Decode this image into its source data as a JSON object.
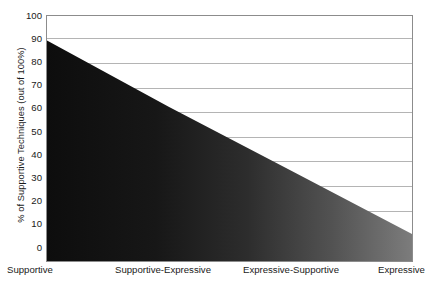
{
  "chart_data": {
    "type": "area",
    "title": "",
    "subtitle": "",
    "xlabel": "",
    "ylabel": "% of Supportive Techniques (out of 100%)",
    "categories": [
      "Supportive",
      "Supportive-Expressive",
      "Expressive-Supportive",
      "Expressive"
    ],
    "x": [
      0,
      1,
      2,
      3
    ],
    "values": [
      90,
      63,
      37,
      11
    ],
    "series": [
      {
        "name": "% of Supportive Techniques",
        "values": [
          90,
          63,
          37,
          11
        ]
      }
    ],
    "ylim": [
      0,
      100
    ],
    "yticks": [
      0,
      10,
      20,
      30,
      40,
      50,
      60,
      70,
      80,
      90,
      100
    ],
    "ytick_labels": [
      "0",
      "10",
      "20",
      "30",
      "40",
      "50",
      "60",
      "70",
      "80",
      "90",
      "100"
    ],
    "xlim": [
      0,
      3
    ],
    "grid": true,
    "grid_axis": "y",
    "legend": false,
    "legend_position": "none",
    "fill": {
      "style": "horizontal-gradient",
      "from_color": "#0d0d0d",
      "to_color": "#7c7c7c"
    },
    "colors": {
      "background": "#ffffff",
      "plot_background": "#ffffff",
      "axis": "#8c8c8c",
      "gridline": "#b4b4b4",
      "text": "#1a1a1a"
    },
    "annotations": []
  },
  "axes": {
    "y_title": "% of Supportive Techniques (out of 100%)",
    "y_ticks": [
      "100",
      "90",
      "80",
      "70",
      "60",
      "50",
      "40",
      "30",
      "20",
      "10",
      "0"
    ],
    "x_ticks": [
      "Supportive",
      "Supportive-Expressive",
      "Expressive-Supportive",
      "Expressive"
    ]
  }
}
